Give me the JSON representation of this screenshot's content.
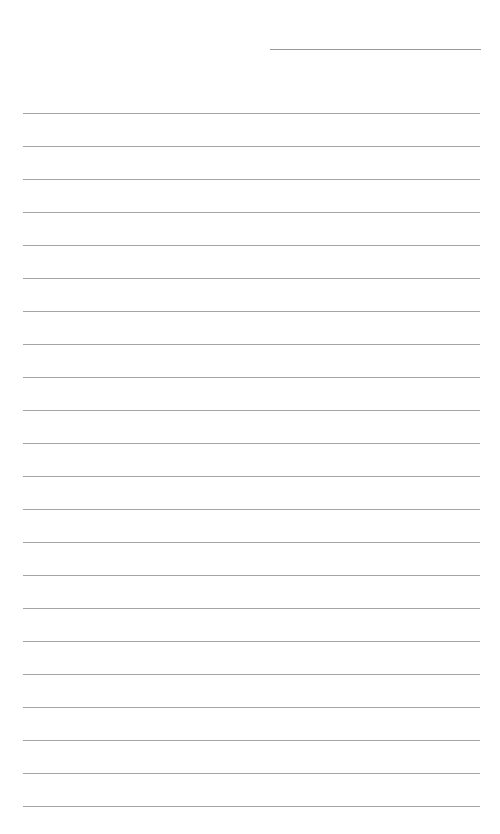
{
  "page": {
    "type": "ruled-notebook-page",
    "background_color": "#ffffff",
    "rule_color": "#a4a4a4",
    "header_line": {
      "x": 270,
      "y": 49,
      "width": 211
    },
    "rules": {
      "count": 22,
      "first_y": 113,
      "spacing": 33,
      "left": 23,
      "width": 457
    },
    "text": ""
  }
}
